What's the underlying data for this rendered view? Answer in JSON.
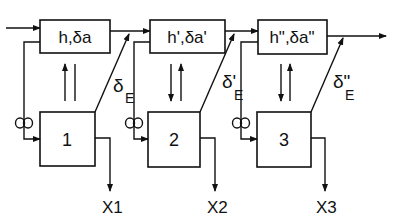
{
  "diagram": {
    "type": "block-diagram",
    "stages": [
      {
        "upper": {
          "label_main": "h",
          "label_sep": ",",
          "label_delta": "δ",
          "label_a": "a",
          "prime": ""
        },
        "lower": {
          "label": "1"
        },
        "coupling": {
          "label": "δ",
          "subscript": "E",
          "prime": ""
        },
        "output": {
          "label": "X1"
        },
        "vertical_arrows": "both-up"
      },
      {
        "upper": {
          "label_main": "h",
          "label_sep": ",",
          "label_delta": "δ",
          "label_a": "a",
          "prime": "'"
        },
        "lower": {
          "label": "2"
        },
        "coupling": {
          "label": "δ",
          "subscript": "E",
          "prime": "'"
        },
        "output": {
          "label": "X2"
        },
        "vertical_arrows": "down-up"
      },
      {
        "upper": {
          "label_main": "h",
          "label_sep": ",",
          "label_delta": "δ",
          "label_a": "a",
          "prime": "\""
        },
        "lower": {
          "label": "3"
        },
        "coupling": {
          "label": "δ",
          "subscript": "E",
          "prime": "\""
        },
        "output": {
          "label": "X3"
        },
        "vertical_arrows": "down-up"
      }
    ],
    "feedback_symbol": "∞",
    "colors": {
      "line": "#111111",
      "background": "#ffffff"
    }
  },
  "text": {
    "box_top_1": "h,δa",
    "box_top_2": "h',δa'",
    "box_top_3": "h\",δa\"",
    "box_bot_1": "1",
    "box_bot_2": "2",
    "box_bot_3": "3",
    "delta_1": "δ",
    "delta_1_sub": "E",
    "delta_2": "δ'",
    "delta_2_sub": "E",
    "delta_3": "δ\"",
    "delta_3_sub": "E",
    "out_1": "X1",
    "out_2": "X2",
    "out_3": "X3",
    "loop_1": "∞",
    "loop_2": "∞",
    "loop_3": "∞"
  }
}
